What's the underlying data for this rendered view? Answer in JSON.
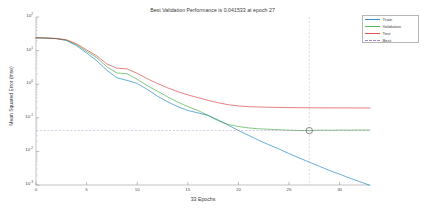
{
  "figure": {
    "title": "Best Validation Performance is 0.041533 at epoch 27",
    "xlabel": "33 Epochs",
    "ylabel": "Mean Squared Error  (mse)",
    "background": "#ffffff"
  },
  "legend": {
    "items": [
      {
        "label": "Train",
        "color": "#0072bd",
        "style": "solid"
      },
      {
        "label": "Validation",
        "color": "#2ca02c",
        "style": "solid"
      },
      {
        "label": "Test",
        "color": "#d62728",
        "style": "solid"
      },
      {
        "label": "Best",
        "color": "#9467bd",
        "style": "dashed"
      }
    ]
  },
  "axes": {
    "y_ticks": [
      {
        "mantissa": "10",
        "exponent": "2",
        "value": 100
      },
      {
        "mantissa": "10",
        "exponent": "1",
        "value": 10
      },
      {
        "mantissa": "10",
        "exponent": "0",
        "value": 1
      },
      {
        "mantissa": "10",
        "exponent": "-1",
        "value": 0.1
      },
      {
        "mantissa": "10",
        "exponent": "-2",
        "value": 0.01
      },
      {
        "mantissa": "10",
        "exponent": "-3",
        "value": 0.001
      }
    ],
    "x_ticks": [
      "0",
      "5",
      "10",
      "15",
      "20",
      "25",
      "30"
    ]
  },
  "chart_data": {
    "type": "line",
    "title": "Best Validation Performance is 0.041533 at epoch 27",
    "xlabel": "33 Epochs",
    "ylabel": "Mean Squared Error  (mse)",
    "yscale": "log",
    "ylim": [
      0.001,
      100
    ],
    "xlim": [
      0,
      33
    ],
    "grid": false,
    "legend_position": "top-right",
    "best_epoch": 27,
    "best_value": 0.041533,
    "x": [
      0,
      1,
      2,
      3,
      4,
      5,
      6,
      7,
      8,
      9,
      10,
      11,
      12,
      13,
      14,
      15,
      16,
      17,
      18,
      19,
      20,
      21,
      22,
      23,
      24,
      25,
      26,
      27,
      28,
      29,
      30,
      31,
      32,
      33
    ],
    "series": [
      {
        "name": "Train",
        "color": "#0072bd",
        "values": [
          24.0,
          23.5,
          22.6,
          20.0,
          14.0,
          8.5,
          5.0,
          2.6,
          1.55,
          1.3,
          1.05,
          0.7,
          0.44,
          0.3,
          0.215,
          0.165,
          0.14,
          0.118,
          0.086,
          0.06,
          0.042,
          0.03,
          0.0215,
          0.0158,
          0.0118,
          0.0086,
          0.0064,
          0.0048,
          0.0036,
          0.0027,
          0.0021,
          0.0016,
          0.00125,
          0.00098
        ]
      },
      {
        "name": "Validation",
        "color": "#2ca02c",
        "values": [
          24.0,
          23.6,
          22.8,
          20.5,
          15.0,
          9.5,
          6.2,
          3.3,
          2.15,
          2.05,
          1.4,
          0.9,
          0.62,
          0.42,
          0.295,
          0.215,
          0.165,
          0.118,
          0.082,
          0.063,
          0.055,
          0.05,
          0.047,
          0.0455,
          0.044,
          0.0428,
          0.042,
          0.041533,
          0.043,
          0.0425,
          0.0432,
          0.0428,
          0.0435,
          0.043
        ]
      },
      {
        "name": "Test",
        "color": "#d62728",
        "values": [
          24.0,
          23.7,
          23.0,
          21.0,
          16.0,
          10.5,
          7.0,
          4.0,
          3.0,
          2.85,
          2.1,
          1.45,
          1.05,
          0.78,
          0.6,
          0.48,
          0.4,
          0.33,
          0.28,
          0.245,
          0.225,
          0.215,
          0.21,
          0.206,
          0.203,
          0.201,
          0.2,
          0.199,
          0.198,
          0.198,
          0.197,
          0.197,
          0.196,
          0.196
        ]
      }
    ],
    "best_marker": {
      "epoch": 27,
      "value": 0.041533,
      "color": "#9467bd",
      "shape": "circle"
    }
  }
}
